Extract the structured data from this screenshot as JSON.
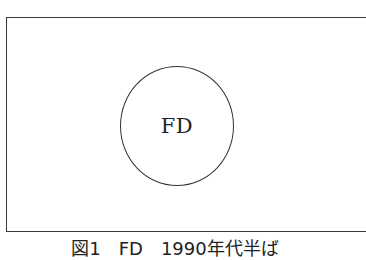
{
  "diagram": {
    "frame": {
      "stroke_color": "#3a3a3a",
      "right_edge_visible": false
    },
    "nodes": [
      {
        "id": "fd",
        "label": "FD",
        "shape": "circle",
        "stroke_color": "#333333"
      }
    ],
    "caption": "図1　FD　1990年代半ば"
  }
}
